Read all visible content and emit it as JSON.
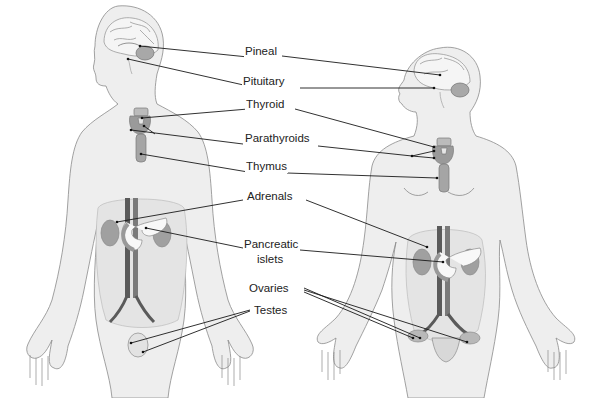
{
  "colors": {
    "skin": "#eeeeee",
    "skin_outline": "#8a8a8a",
    "shadow": "#dcdcdc",
    "gland": "#9a9a9a",
    "gland_dark": "#7a7a7a",
    "vessel_dark": "#555555",
    "leader": "#1a1a1a",
    "text": "#222222"
  },
  "figures": [
    {
      "name": "male",
      "side": "left"
    },
    {
      "name": "female",
      "side": "right"
    }
  ],
  "labels": [
    {
      "id": "pineal",
      "text": "Pineal",
      "x": 262,
      "y": 51
    },
    {
      "id": "pituitary",
      "text": "Pituitary",
      "x": 268,
      "y": 81
    },
    {
      "id": "thyroid",
      "text": "Thyroid",
      "x": 266,
      "y": 104
    },
    {
      "id": "parathyroids",
      "text": "Parathyroids",
      "x": 277,
      "y": 138
    },
    {
      "id": "thymus",
      "text": "Thymus",
      "x": 266,
      "y": 166
    },
    {
      "id": "adrenals",
      "text": "Adrenals",
      "x": 272,
      "y": 196
    },
    {
      "id": "pancreatic_islets_1",
      "text": "Pancreatic",
      "x": 271,
      "y": 244
    },
    {
      "id": "pancreatic_islets_2",
      "text": "islets",
      "x": 271,
      "y": 259
    },
    {
      "id": "ovaries",
      "text": "Ovaries",
      "x": 269,
      "y": 288
    },
    {
      "id": "testes",
      "text": "Testes",
      "x": 272,
      "y": 310
    }
  ],
  "leaders": {
    "male": [
      {
        "to": "pineal",
        "x1": 140,
        "y1": 46,
        "x2": 248,
        "y2": 57
      },
      {
        "to": "pituitary",
        "x1": 128,
        "y1": 59,
        "x2": 248,
        "y2": 86
      },
      {
        "to": "thyroid",
        "x1": 142,
        "y1": 118,
        "x2": 248,
        "y2": 109
      },
      {
        "to": "parathyroids",
        "x1": 131,
        "y1": 130,
        "x2": 243,
        "y2": 144
      },
      {
        "to": "parathyroids",
        "x1": 144,
        "y1": 126,
        "x2": 155,
        "y2": 134
      },
      {
        "to": "thymus",
        "x1": 141,
        "y1": 154,
        "x2": 248,
        "y2": 172
      },
      {
        "to": "adrenals",
        "x1": 117,
        "y1": 222,
        "x2": 243,
        "y2": 200
      },
      {
        "to": "pancreatic",
        "x1": 146,
        "y1": 228,
        "x2": 243,
        "y2": 248
      },
      {
        "to": "testes",
        "x1": 131,
        "y1": 343,
        "x2": 250,
        "y2": 310
      },
      {
        "to": "testes",
        "x1": 143,
        "y1": 352,
        "x2": 250,
        "y2": 311
      }
    ],
    "female": [
      {
        "to": "pineal",
        "x1": 282,
        "y1": 56,
        "x2": 440,
        "y2": 75
      },
      {
        "to": "pituitary",
        "x1": 300,
        "y1": 88,
        "x2": 434,
        "y2": 88
      },
      {
        "to": "thyroid",
        "x1": 295,
        "y1": 109,
        "x2": 434,
        "y2": 147
      },
      {
        "to": "parathyroids",
        "x1": 318,
        "y1": 146,
        "x2": 412,
        "y2": 156
      },
      {
        "to": "parathyroids",
        "x1": 412,
        "y1": 156,
        "x2": 434,
        "y2": 151
      },
      {
        "to": "parathyroids",
        "x1": 412,
        "y1": 156,
        "x2": 434,
        "y2": 158
      },
      {
        "to": "thymus",
        "x1": 287,
        "y1": 173,
        "x2": 437,
        "y2": 178
      },
      {
        "to": "adrenals",
        "x1": 306,
        "y1": 200,
        "x2": 427,
        "y2": 247
      },
      {
        "to": "pancreatic",
        "x1": 300,
        "y1": 250,
        "x2": 443,
        "y2": 262
      },
      {
        "to": "ovaries",
        "x1": 304,
        "y1": 288,
        "x2": 420,
        "y2": 338
      },
      {
        "to": "ovaries",
        "x1": 304,
        "y1": 290,
        "x2": 467,
        "y2": 342
      },
      {
        "to": "ovaries",
        "x1": 304,
        "y1": 292,
        "x2": 413,
        "y2": 338
      }
    ]
  }
}
